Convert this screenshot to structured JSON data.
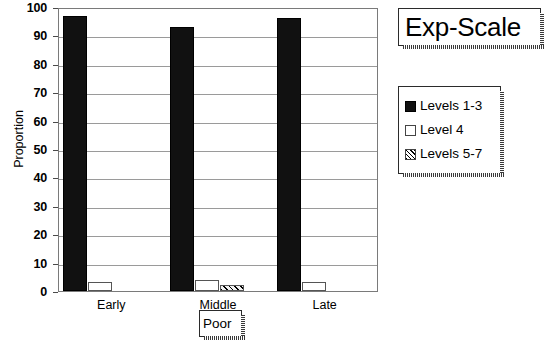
{
  "title_box": {
    "text": "Exp-Scale"
  },
  "poor_box": {
    "text": "Poor"
  },
  "axes": {
    "y_title": "Proportion",
    "y_ticks": [
      "0",
      "10",
      "20",
      "30",
      "40",
      "50",
      "60",
      "70",
      "80",
      "90",
      "100"
    ],
    "x_categories": [
      "Early",
      "Middle",
      "Late"
    ]
  },
  "legend": {
    "items": [
      {
        "label": "Levels 1-3",
        "swatch": "solid-black"
      },
      {
        "label": "Level 4",
        "swatch": "open-white"
      },
      {
        "label": "Levels 5-7",
        "swatch": "diagonal-hatch"
      }
    ]
  },
  "chart_data": {
    "type": "bar",
    "title": "Exp-Scale",
    "xlabel": "Poor",
    "ylabel": "Proportion",
    "ylim": [
      0,
      100
    ],
    "ytick_step": 10,
    "grid": true,
    "legend_position": "right",
    "categories": [
      "Early",
      "Middle",
      "Late"
    ],
    "series": [
      {
        "name": "Levels 1-3",
        "values": [
          97,
          93,
          96
        ]
      },
      {
        "name": "Level 4",
        "values": [
          3,
          4,
          3
        ]
      },
      {
        "name": "Levels 5-7",
        "values": [
          0,
          2,
          0
        ]
      }
    ]
  }
}
